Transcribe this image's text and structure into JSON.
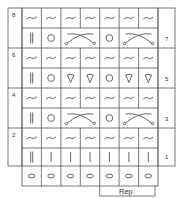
{
  "chart": {
    "columns": 7,
    "left_row_labels": [
      "8",
      "6",
      "4",
      "2"
    ],
    "right_row_labels": [
      "7",
      "5",
      "3",
      "1"
    ],
    "rows": [
      {
        "row": 8,
        "cells": [
          "purl-wave",
          "purl-wave",
          "purl-wave",
          "purl-wave",
          "purl-wave",
          "purl-wave",
          "purl-wave"
        ]
      },
      {
        "row": 7,
        "cells": [
          "double-bar",
          "circle",
          "cross-2",
          "cross-2",
          "circle",
          "cross-2",
          "cross-2",
          "bar"
        ]
      },
      {
        "row": 6,
        "cells": [
          "purl-wave",
          "purl-wave",
          "purl-wave",
          "purl-wave",
          "purl-wave",
          "purl-wave",
          "purl-wave"
        ]
      },
      {
        "row": 5,
        "cells": [
          "double-bar",
          "circle",
          "teardrop",
          "teardrop",
          "circle",
          "teardrop",
          "teardrop",
          "bar"
        ]
      },
      {
        "row": 4,
        "cells": [
          "purl-wave",
          "purl-wave",
          "purl-wave",
          "purl-wave",
          "purl-wave",
          "purl-wave",
          "purl-wave"
        ]
      },
      {
        "row": 3,
        "cells": [
          "double-bar",
          "circle",
          "cross-2",
          "cross-2",
          "circle",
          "cross-2",
          "cross-2",
          "bar"
        ]
      },
      {
        "row": 2,
        "cells": [
          "purl-wave",
          "purl-wave",
          "purl-wave",
          "purl-wave",
          "purl-wave",
          "purl-wave",
          "purl-wave"
        ]
      },
      {
        "row": 1,
        "cells": [
          "double-bar",
          "bar",
          "bar",
          "bar",
          "bar",
          "bar",
          "bar"
        ]
      },
      {
        "row": "cast-on",
        "cells": [
          "oval",
          "oval",
          "oval",
          "oval",
          "oval",
          "oval",
          "oval"
        ]
      }
    ],
    "repeat_label": "Rep",
    "repeat_span": {
      "from_col": 5,
      "to_col": 7
    },
    "line_color": "#555555"
  }
}
